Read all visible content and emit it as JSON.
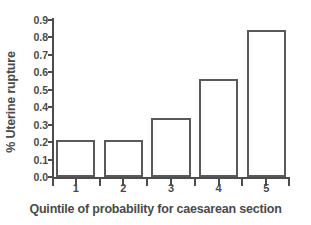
{
  "chart_data": {
    "type": "bar",
    "title": "",
    "subtitle": "",
    "xlabel": "Quintile of probability for caesarean section",
    "ylabel": "% Uterine rupture",
    "categories": [
      "1",
      "2",
      "3",
      "4",
      "5"
    ],
    "values": [
      0.21,
      0.21,
      0.34,
      0.56,
      0.84
    ],
    "series": [
      {
        "name": "% Uterine rupture",
        "values": [
          0.21,
          0.21,
          0.34,
          0.56,
          0.84
        ]
      }
    ],
    "ylim": [
      0.0,
      0.9
    ],
    "xlim": [
      0.5,
      5.5
    ],
    "ytick_labels": [
      "0.0",
      "0.1",
      "0.2",
      "0.3",
      "0.4",
      "0.5",
      "0.6",
      "0.7",
      "0.8",
      "0.9"
    ],
    "ytick_values": [
      0.0,
      0.1,
      0.2,
      0.3,
      0.4,
      0.5,
      0.6,
      0.7,
      0.8,
      0.9
    ],
    "xtick_labels": [
      "1",
      "2",
      "3",
      "4",
      "5"
    ],
    "grid": false,
    "legend": false,
    "legend_position": "none",
    "bar_fill_color": "#ffffff",
    "bar_edge_color": "#595959",
    "axis_color": "#4d4d4d",
    "text_color": "#4a4a4a",
    "background_color": "#ffffff",
    "annotations": []
  }
}
